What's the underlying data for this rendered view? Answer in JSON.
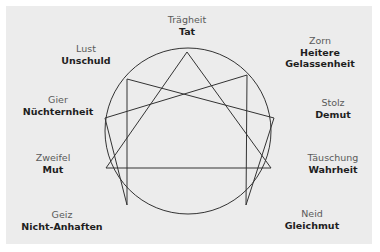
{
  "diagram": {
    "type": "enneagram",
    "background_color": "#ececec",
    "line_color": "#333333",
    "circle": {
      "cx": 188,
      "cy": 131,
      "r": 83
    },
    "points": [
      {
        "id": 9,
        "vice": "Trägheit",
        "virtue": "Tat",
        "x": 187,
        "y": 52,
        "label_x": 187,
        "label_y": 14
      },
      {
        "id": 1,
        "vice": "Zorn",
        "virtue": "Heitere Gelassenheit",
        "virtue_lines": [
          "Heitere",
          "Gelassenheit"
        ],
        "x": 247,
        "y": 75,
        "label_x": 320,
        "label_y": 35
      },
      {
        "id": 2,
        "vice": "Stolz",
        "virtue": "Demut",
        "x": 274,
        "y": 118,
        "label_x": 333,
        "label_y": 97
      },
      {
        "id": 3,
        "vice": "Täuschung",
        "virtue": "Wahrheit",
        "x": 271,
        "y": 168,
        "label_x": 333,
        "label_y": 152
      },
      {
        "id": 4,
        "vice": "Neid",
        "virtue": "Gleichmut",
        "x": 246,
        "y": 205,
        "label_x": 312,
        "label_y": 208
      },
      {
        "id": 5,
        "vice": "Geiz",
        "virtue": "Nicht-Anhaften",
        "x": 127,
        "y": 205,
        "label_x": 62,
        "label_y": 209
      },
      {
        "id": 6,
        "vice": "Zweifel",
        "virtue": "Mut",
        "x": 106,
        "y": 168,
        "label_x": 53,
        "label_y": 152
      },
      {
        "id": 7,
        "vice": "Gier",
        "virtue": "Nüchternheit",
        "x": 105,
        "y": 118,
        "label_x": 58,
        "label_y": 94
      },
      {
        "id": 8,
        "vice": "Lust",
        "virtue": "Unschuld",
        "x": 127,
        "y": 79,
        "label_x": 86,
        "label_y": 43
      }
    ],
    "triangle": [
      9,
      3,
      6
    ],
    "hexad": [
      1,
      4,
      2,
      8,
      5,
      7
    ]
  },
  "labels": {
    "p9": {
      "vice": "Trägheit",
      "virtue": "Tat"
    },
    "p1": {
      "vice": "Zorn",
      "virtue1": "Heitere",
      "virtue2": "Gelassenheit"
    },
    "p2": {
      "vice": "Stolz",
      "virtue": "Demut"
    },
    "p3": {
      "vice": "Täuschung",
      "virtue": "Wahrheit"
    },
    "p4": {
      "vice": "Neid",
      "virtue": "Gleichmut"
    },
    "p5": {
      "vice": "Geiz",
      "virtue": "Nicht-Anhaften"
    },
    "p6": {
      "vice": "Zweifel",
      "virtue": "Mut"
    },
    "p7": {
      "vice": "Gier",
      "virtue": "Nüchternheit"
    },
    "p8": {
      "vice": "Lust",
      "virtue": "Unschuld"
    }
  }
}
